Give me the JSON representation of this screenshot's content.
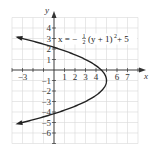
{
  "chart_data": {
    "type": "line",
    "title": "",
    "equation": "x = -1/2 (y + 1)^2 + 5",
    "equation_label": {
      "lhs": "x = −",
      "frac_num": "1",
      "frac_den": "2",
      "rhs": "(y + 1)",
      "exp": "2",
      "tail": " + 5"
    },
    "xlabel": "x",
    "ylabel": "y",
    "xlim": [
      -4,
      8
    ],
    "ylim": [
      -7,
      5
    ],
    "grid": true,
    "x_tick_labels": [
      "−3",
      "1",
      "2",
      "3",
      "4",
      "6",
      "7"
    ],
    "x_tick_values": [
      -3,
      1,
      2,
      3,
      4,
      6,
      7
    ],
    "y_tick_labels": [
      "4",
      "3",
      "2",
      "1",
      "−1",
      "−2",
      "−3",
      "−4",
      "−5",
      "−6"
    ],
    "y_tick_values": [
      4,
      3,
      2,
      1,
      -1,
      -2,
      -3,
      -4,
      -5,
      -6
    ],
    "series": [
      {
        "name": "x = -1/2 (y + 1)^2 + 5",
        "vertex": {
          "x": 5,
          "y": -1
        },
        "points": [
          {
            "x": -3.5,
            "y": 3.12
          },
          {
            "x": -3,
            "y": 3
          },
          {
            "x": -1.5,
            "y": 2.61
          },
          {
            "x": 0.5,
            "y": 2
          },
          {
            "x": 3,
            "y": 1
          },
          {
            "x": 4.5,
            "y": 0
          },
          {
            "x": 5,
            "y": -1
          },
          {
            "x": 4.5,
            "y": -2
          },
          {
            "x": 3,
            "y": -3
          },
          {
            "x": 0.5,
            "y": -4
          },
          {
            "x": -1.5,
            "y": -4.61
          },
          {
            "x": -3,
            "y": -5
          },
          {
            "x": -3.5,
            "y": -5.12
          }
        ],
        "y_intercepts": [
          2.16,
          -4.16
        ],
        "arrows": "both ends pointing left"
      }
    ],
    "colors": {
      "curve": "#222222",
      "grid": "#d8d8d8",
      "axes": "#333333"
    }
  }
}
